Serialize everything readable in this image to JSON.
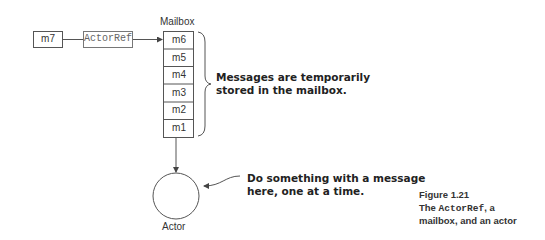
{
  "diagram": {
    "incoming_message": "m7",
    "actor_ref": "ActorRef",
    "mailbox": {
      "title": "Mailbox",
      "messages": [
        "m6",
        "m5",
        "m4",
        "m3",
        "m2",
        "m1"
      ]
    },
    "actor_label": "Actor",
    "annotations": {
      "mailbox_note_line1": "Messages are temporarily",
      "mailbox_note_line2": "stored in the mailbox.",
      "actor_note_line1": "Do something with a message",
      "actor_note_line2": "here, one at a time."
    }
  },
  "caption": {
    "figure": "Figure 1.21",
    "line1_prefix": "The ",
    "line1_code": "ActorRef",
    "line1_suffix": ", a",
    "line2": "mailbox, and an actor"
  },
  "colors": {
    "stroke": "#555555",
    "text": "#222222"
  }
}
